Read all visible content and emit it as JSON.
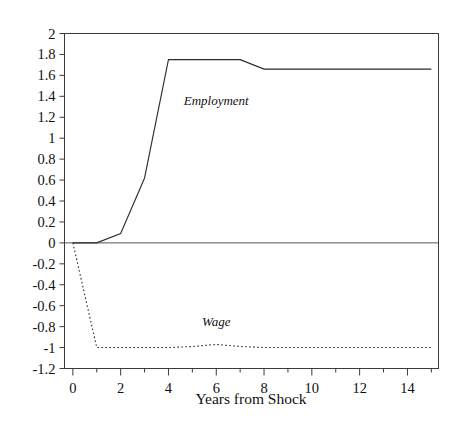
{
  "chart_data": {
    "type": "line",
    "title": "",
    "subtitle": "",
    "xlabel": "Years from Shock",
    "ylabel": "",
    "xlim": [
      -0.35,
      15.3
    ],
    "ylim": [
      -1.2,
      2
    ],
    "grid": false,
    "legend_position": "inline-annotations",
    "x_ticks_major": [
      0,
      2,
      4,
      6,
      8,
      10,
      12,
      14
    ],
    "x_ticks_minor": [
      1,
      3,
      5,
      7,
      9,
      11,
      13,
      15
    ],
    "x_tick_labels": [
      "0",
      "2",
      "4",
      "6",
      "8",
      "10",
      "12",
      "14"
    ],
    "y_ticks": [
      -1.2,
      -1,
      -0.8,
      -0.6,
      -0.4,
      -0.2,
      0,
      0.2,
      0.4,
      0.6,
      0.8,
      1,
      1.2,
      1.4,
      1.6,
      1.8,
      2
    ],
    "y_tick_labels": [
      "-1.2",
      "-1",
      "-0.8",
      "-0.6",
      "-0.4",
      "-0.2",
      "0",
      "0.2",
      "0.4",
      "0.6",
      "0.8",
      "1",
      "1.2",
      "1.4",
      "1.6",
      "1.8",
      "2"
    ],
    "zero_line": 0,
    "x": [
      0,
      1,
      2,
      3,
      4,
      5,
      6,
      7,
      8,
      9,
      10,
      11,
      12,
      13,
      14,
      15
    ],
    "series": [
      {
        "name": "Employment",
        "style": "solid",
        "label_x": 6.0,
        "label_y": 1.32,
        "values": [
          0,
          0,
          0.09,
          0.62,
          1.75,
          1.75,
          1.75,
          1.75,
          1.66,
          1.66,
          1.66,
          1.66,
          1.66,
          1.66,
          1.66,
          1.66
        ]
      },
      {
        "name": "Wage",
        "style": "dotted",
        "label_x": 6.0,
        "label_y": -0.79,
        "values": [
          0,
          -1.0,
          -1.0,
          -1.0,
          -1.0,
          -0.99,
          -0.97,
          -0.99,
          -1.0,
          -1.0,
          -1.0,
          -1.0,
          -1.0,
          -1.0,
          -1.0,
          -1.0
        ]
      }
    ]
  },
  "colors": {
    "background": "#ffffff",
    "axis": "#3a3a3a",
    "series": "#2b2b2b"
  }
}
